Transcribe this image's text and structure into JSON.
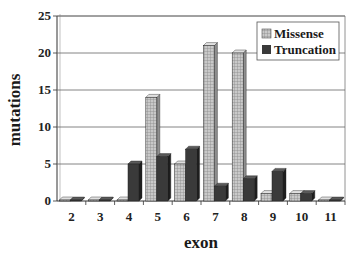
{
  "chart_data": {
    "type": "bar",
    "title": "",
    "xlabel": "exon",
    "ylabel": "mutations",
    "ylim": [
      0,
      25
    ],
    "yticks": [
      0,
      5,
      10,
      15,
      20,
      25
    ],
    "grid": true,
    "legend_position": "top-right",
    "categories": [
      "2",
      "3",
      "4",
      "5",
      "6",
      "7",
      "8",
      "9",
      "10",
      "11"
    ],
    "series": [
      {
        "name": "Missense",
        "values": [
          0,
          0,
          0,
          14,
          5,
          21,
          20,
          1,
          1,
          0
        ],
        "color": "#b8b8b8",
        "pattern": "grid"
      },
      {
        "name": "Truncation",
        "values": [
          0,
          0,
          5,
          6,
          7,
          2,
          3,
          4,
          1,
          0
        ],
        "color": "#3a3a3a",
        "pattern": "solid"
      }
    ]
  },
  "legend": {
    "items": [
      "Missense",
      "Truncation"
    ]
  },
  "axes": {
    "x_title": "exon",
    "y_title": "mutations"
  }
}
